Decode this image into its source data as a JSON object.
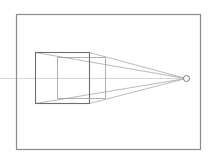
{
  "diagram": {
    "type": "one-point-perspective",
    "colors": {
      "background": "#ffffff",
      "frame": "#8a8a8a",
      "box": "#6e6e6e",
      "back_face": "#9a9a9a",
      "convergence": "#a8a8a8",
      "horizon": "#d8d8d8",
      "vanishing_point": "#777777"
    },
    "frame": {
      "x": 16,
      "y": 14,
      "width": 184,
      "height": 135
    },
    "horizon_line": {
      "x1": 0,
      "y1": 78,
      "x2": 183,
      "y2": 78
    },
    "vanishing_point": {
      "cx": 186,
      "cy": 78,
      "r": 3
    },
    "front_face": {
      "x": 35,
      "y": 52,
      "width": 54,
      "height": 51
    },
    "back_face": {
      "x1": 57,
      "x2": 105,
      "top_left_y": 57,
      "bottom_left_y": 98,
      "top_right_y": 57,
      "bottom_right_y": 98
    },
    "convergence_lines": [
      {
        "from": [
          35,
          52
        ],
        "to": [
          186,
          78
        ]
      },
      {
        "from": [
          35,
          103
        ],
        "to": [
          186,
          78
        ]
      },
      {
        "from": [
          89,
          52
        ],
        "to": [
          186,
          78
        ]
      },
      {
        "from": [
          89,
          103
        ],
        "to": [
          186,
          78
        ]
      }
    ]
  }
}
